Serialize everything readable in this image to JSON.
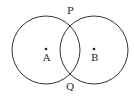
{
  "diagram": {
    "circles": [
      {
        "name": "A",
        "cx": 46,
        "cy": 50,
        "r": 34
      },
      {
        "name": "B",
        "cx": 94,
        "cy": 50,
        "r": 34
      }
    ],
    "points": {
      "A": {
        "label": "A",
        "x": 46,
        "y": 50
      },
      "B": {
        "label": "B",
        "x": 94,
        "y": 50
      },
      "P": {
        "label": "P",
        "x": 70,
        "y": 17
      },
      "Q": {
        "label": "Q",
        "x": 70,
        "y": 83
      }
    },
    "stroke_color": "#333333"
  }
}
